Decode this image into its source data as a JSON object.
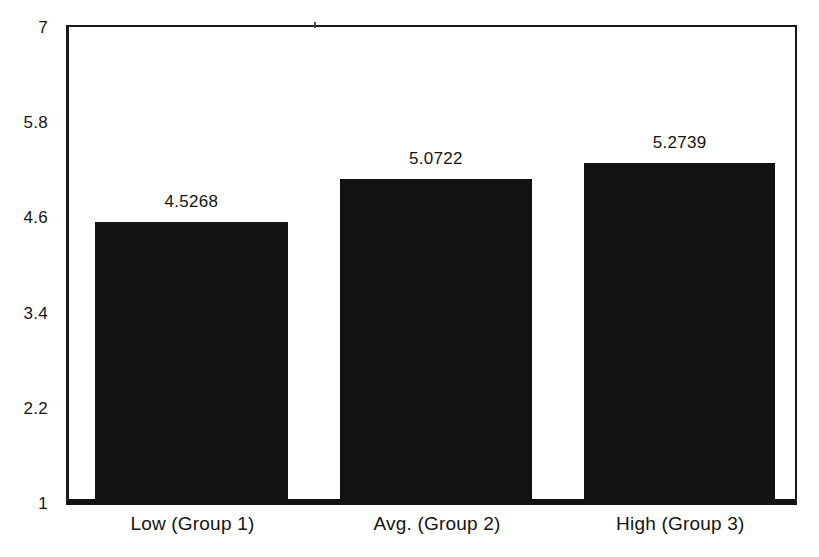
{
  "figure": {
    "background": "#ffffff",
    "kind": "scanned grouped-means bar chart"
  },
  "chart_data": {
    "type": "bar",
    "categories": [
      "Low (Group 1)",
      "Avg. (Group 2)",
      "High (Group 3)"
    ],
    "values": [
      4.5268,
      5.0722,
      5.2739
    ],
    "value_labels": [
      "4.5268",
      "5.0722",
      "5.2739"
    ],
    "ylim": [
      1,
      7
    ],
    "yticks": [
      1,
      2.2,
      3.4,
      4.6,
      5.8,
      7
    ],
    "ytick_labels": [
      "1",
      "2.2",
      "3.4",
      "4.6",
      "5.8",
      "7"
    ],
    "grid": false,
    "legend": false,
    "bar_color": "#131313",
    "axis_color": "#1b1b1b",
    "text_color": "#141414"
  }
}
